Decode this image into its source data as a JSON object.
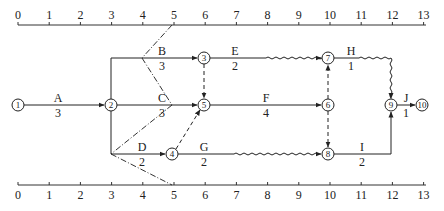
{
  "diagram": {
    "type": "time-scaled network diagram",
    "time_axis": {
      "ticks": [
        "0",
        "1",
        "2",
        "3",
        "4",
        "5",
        "6",
        "7",
        "8",
        "9",
        "10",
        "11",
        "12",
        "13"
      ]
    },
    "nodes": [
      {
        "id": "1",
        "label": "①"
      },
      {
        "id": "2",
        "label": "②"
      },
      {
        "id": "3",
        "label": "③"
      },
      {
        "id": "4",
        "label": "④"
      },
      {
        "id": "5",
        "label": "⑤"
      },
      {
        "id": "6",
        "label": "⑥"
      },
      {
        "id": "7",
        "label": "⑦"
      },
      {
        "id": "8",
        "label": "⑧"
      },
      {
        "id": "9",
        "label": "⑨"
      },
      {
        "id": "10",
        "label": "⑩"
      }
    ],
    "activities": [
      {
        "name": "A",
        "duration": "3",
        "from": "1",
        "to": "2"
      },
      {
        "name": "B",
        "duration": "3",
        "from": "2",
        "to": "3"
      },
      {
        "name": "C",
        "duration": "3",
        "from": "2",
        "to": "5"
      },
      {
        "name": "D",
        "duration": "2",
        "from": "2",
        "to": "4"
      },
      {
        "name": "E",
        "duration": "2",
        "from": "3",
        "to": "7"
      },
      {
        "name": "F",
        "duration": "4",
        "from": "5",
        "to": "6"
      },
      {
        "name": "G",
        "duration": "2",
        "from": "4",
        "to": "8"
      },
      {
        "name": "H",
        "duration": "1",
        "from": "7",
        "to": "9"
      },
      {
        "name": "I",
        "duration": "2",
        "from": "8",
        "to": "9"
      },
      {
        "name": "J",
        "duration": "1",
        "from": "9",
        "to": "10"
      }
    ],
    "dummies": [
      {
        "from": "3",
        "to": "5"
      },
      {
        "from": "4",
        "to": "5"
      },
      {
        "from": "6",
        "to": "7"
      },
      {
        "from": "6",
        "to": "8"
      }
    ],
    "check_line": {
      "style": "dash-dot",
      "label": "check-line at time 5"
    }
  }
}
